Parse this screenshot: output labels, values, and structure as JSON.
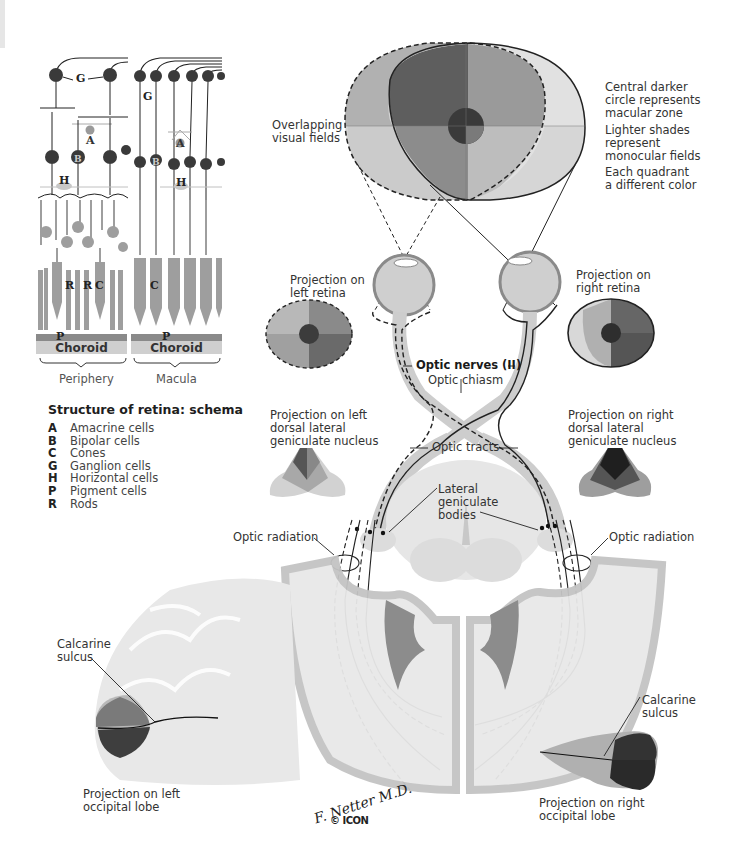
{
  "retina_schema": {
    "title": "Structure of retina: schema",
    "panels": [
      {
        "name": "Periphery",
        "layer_label": "Choroid",
        "pigment_label": "P",
        "cell_labels": [
          "G",
          "A",
          "B",
          "H",
          "R",
          "R",
          "C"
        ]
      },
      {
        "name": "Macula",
        "layer_label": "Choroid",
        "pigment_label": "P",
        "cell_labels": [
          "G",
          "A",
          "B",
          "H",
          "C"
        ]
      }
    ],
    "legend": [
      {
        "key": "A",
        "label": "Amacrine cells"
      },
      {
        "key": "B",
        "label": "Bipolar cells"
      },
      {
        "key": "C",
        "label": "Cones"
      },
      {
        "key": "G",
        "label": "Ganglion cells"
      },
      {
        "key": "H",
        "label": "Horizontal cells"
      },
      {
        "key": "P",
        "label": "Pigment cells"
      },
      {
        "key": "R",
        "label": "Rods"
      }
    ]
  },
  "visual_fields": {
    "label_overlap": "Overlapping\nvisual fields",
    "notes": [
      "Central darker\ncircle represents\nmacular zone",
      "Lighter shades\nrepresent\nmonocular fields",
      "Each quadrant\na different color"
    ]
  },
  "pathway_labels": {
    "left_retina": "Projection on\nleft retina",
    "right_retina": "Projection on\nright retina",
    "optic_nerves": "Optic nerves (II)",
    "optic_chiasm": "Optic chiasm",
    "left_lgn": "Projection on left\ndorsal lateral\ngeniculate nucleus",
    "right_lgn": "Projection on right\ndorsal lateral\ngeniculate nucleus",
    "optic_tracts": "Optic tracts",
    "lateral_geniculate": "Lateral\ngeniculate\nbodies",
    "optic_radiation_left": "Optic radiation",
    "optic_radiation_right": "Optic radiation",
    "calcarine_left": "Calcarine\nsulcus",
    "calcarine_right": "Calcarine\nsulcus",
    "left_occipital": "Projection on left\noccipital lobe",
    "right_occipital": "Projection on right\noccipital lobe"
  },
  "credits": {
    "signature": "F. Netter M.D.",
    "copyright": "© ICON"
  },
  "colors": {
    "quad_dark": "#555555",
    "quad_mid": "#8a8a8a",
    "quad_light": "#b4b4b4",
    "quad_pale": "#d2d2d2",
    "macula": "#3a3a3a",
    "cell_dark": "#3a3a3a",
    "cell_gray": "#9a9a9a",
    "brain": "#e4e4e4"
  }
}
